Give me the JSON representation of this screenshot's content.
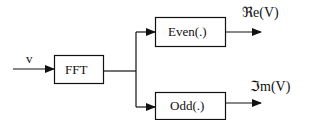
{
  "diagram": {
    "input": {
      "label": "v"
    },
    "blocks": [
      {
        "id": "fft",
        "label": "FFT"
      },
      {
        "id": "even",
        "label": "Even(.)"
      },
      {
        "id": "odd",
        "label": "Odd(.)"
      }
    ],
    "outputs": [
      {
        "id": "real",
        "label": "ℜe(V)"
      },
      {
        "id": "imag",
        "label": "ℑm(V)"
      }
    ],
    "colors": {
      "line": "#111111",
      "background": "#ffffff"
    }
  }
}
